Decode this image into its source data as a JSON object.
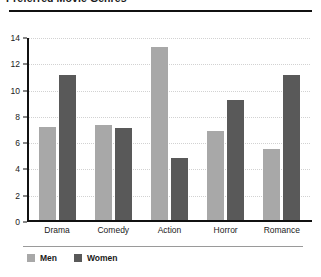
{
  "chart_data": {
    "type": "bar",
    "title": "Preferred Movie Genres",
    "xlabel": "",
    "ylabel": "",
    "ylim": [
      0,
      14
    ],
    "yticks": [
      0,
      2,
      4,
      6,
      8,
      10,
      12,
      14
    ],
    "grid": true,
    "legend_position": "bottom-left",
    "categories": [
      "Drama",
      "Comedy",
      "Action",
      "Horror",
      "Romance"
    ],
    "series": [
      {
        "name": "Men",
        "color": "#a8a8a8",
        "values": [
          7.1,
          7.2,
          13.2,
          6.8,
          5.4
        ]
      },
      {
        "name": "Women",
        "color": "#595959",
        "values": [
          11.0,
          7.0,
          4.7,
          9.1,
          11.0
        ]
      }
    ]
  }
}
